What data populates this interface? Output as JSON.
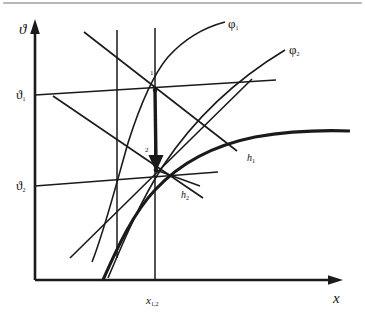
{
  "figure": {
    "kind": "mollier-hx-diagram",
    "background_color": "#ffffff",
    "line_color": "#1a1a1a",
    "top_rule_color": "#b8b8b8"
  },
  "axes": {
    "y_label": "ϑ",
    "x_label": "x",
    "origin": {
      "x": 35,
      "y": 280
    },
    "y_top": {
      "x": 35,
      "y": 22
    },
    "x_right": {
      "x": 340,
      "y": 280
    }
  },
  "y_ticks": [
    {
      "id": "theta1",
      "label": "ϑ",
      "sub": "1",
      "value_y": 94
    },
    {
      "id": "theta2",
      "label": "ϑ",
      "sub": "2",
      "value_y": 185
    }
  ],
  "x_ticks": [
    {
      "id": "x12",
      "label": "x",
      "sub": "1,2",
      "value_x": 155
    }
  ],
  "curves": [
    {
      "name": "phi1",
      "label": "φ",
      "sub": "1",
      "label_x": 228,
      "label_y": 18,
      "role": "relative-humidity-line"
    },
    {
      "name": "phi2",
      "label": "φ",
      "sub": "2",
      "label_x": 289,
      "label_y": 44,
      "role": "relative-humidity-line"
    },
    {
      "name": "saturation",
      "label": "",
      "sub": "",
      "role": "saturation-curve-phi-100"
    }
  ],
  "enthalpy_lines": [
    {
      "name": "h1",
      "label": "h",
      "sub": "1",
      "label_x": 248,
      "label_y": 150
    },
    {
      "name": "h2",
      "label": "h",
      "sub": "2",
      "label_x": 182,
      "label_y": 186
    }
  ],
  "state_points": [
    {
      "name": "point-1",
      "label": "1",
      "x": 155,
      "y": 90,
      "label_x": 150,
      "label_y": 70
    },
    {
      "name": "point-2",
      "label": "2",
      "x": 156,
      "y": 170,
      "label_x": 146,
      "label_y": 148
    }
  ],
  "process_arrow": {
    "name": "cooling-process-arrow",
    "from_x": 155,
    "from_y": 90,
    "to_x": 156,
    "to_y": 170,
    "direction": "down"
  }
}
